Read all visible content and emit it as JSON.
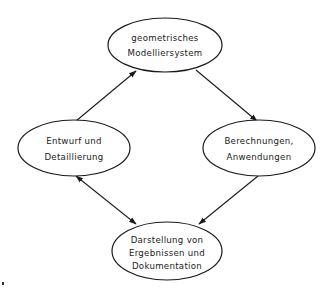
{
  "diagram": {
    "type": "cycle-flow",
    "colors": {
      "stroke": "#1a1a1a",
      "background": "#ffffff"
    },
    "nodes": [
      {
        "id": "top",
        "shape": "ellipse",
        "cx": 165,
        "cy": 45,
        "rx": 57,
        "ry": 27,
        "lines": [
          "geometrisches",
          "Modelliersystem"
        ]
      },
      {
        "id": "left",
        "shape": "ellipse",
        "cx": 74,
        "cy": 148,
        "rx": 56,
        "ry": 28,
        "lines": [
          "Entwurf und",
          "Detaillierung"
        ]
      },
      {
        "id": "right",
        "shape": "ellipse",
        "cx": 259,
        "cy": 148,
        "rx": 56,
        "ry": 28,
        "lines": [
          "Berechnungen,",
          "Anwendungen"
        ]
      },
      {
        "id": "bottom",
        "shape": "ellipse",
        "cx": 167,
        "cy": 251,
        "rx": 55,
        "ry": 29,
        "lines": [
          "Darstellung von",
          "Ergebnissen und",
          "Dokumentation"
        ]
      }
    ],
    "edges": [
      {
        "from": "left",
        "to": "top",
        "arrow": "end"
      },
      {
        "from": "top",
        "to": "right",
        "arrow": "end"
      },
      {
        "from": "right",
        "to": "bottom",
        "arrow": "end"
      },
      {
        "from": "left",
        "to": "bottom",
        "arrow": "both"
      }
    ]
  }
}
